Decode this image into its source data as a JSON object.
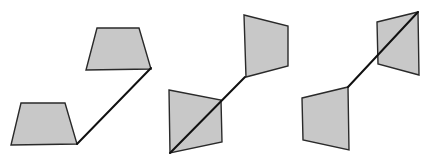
{
  "diagram": {
    "colors": {
      "fill": "#c8c8c8",
      "stroke": "#2a2a2a",
      "line": "#111111",
      "background": "#ffffff"
    },
    "figures": [
      {
        "id": "figure-1",
        "shapes": [
          {
            "name": "lower-trapezoid",
            "points": "21,103 65,103 77,144 11,145"
          },
          {
            "name": "upper-trapezoid",
            "points": "97,28 139,28 151,69 86,70"
          }
        ],
        "connector": {
          "x1": 77,
          "y1": 144,
          "x2": 151,
          "y2": 68
        }
      },
      {
        "id": "figure-2",
        "shapes": [
          {
            "name": "lower-quad",
            "points": "169,90 221,100 222,142 170,153"
          },
          {
            "name": "upper-quad",
            "points": "244,15 288,26 288,66 246,77"
          }
        ],
        "connector": {
          "x1": 170,
          "y1": 153,
          "x2": 245,
          "y2": 77
        }
      },
      {
        "id": "figure-3",
        "shapes": [
          {
            "name": "lower-quad",
            "points": "302,98 348,87 349,150 303,140"
          },
          {
            "name": "upper-quad",
            "points": "377,22 418,12 419,75 378,64"
          }
        ],
        "connector": {
          "x1": 348,
          "y1": 87,
          "x2": 418,
          "y2": 12
        }
      }
    ]
  }
}
